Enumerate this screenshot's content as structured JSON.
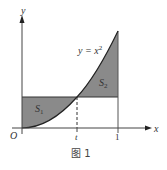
{
  "figure": {
    "caption": "图 1",
    "curve_label": "y = x",
    "curve_label_exp": "2",
    "axis_x_label": "x",
    "axis_y_label": "y",
    "origin_label": "O",
    "tick_t_label": "t",
    "tick_one_label": "1",
    "region1_label": "S",
    "region1_sub": "1",
    "region2_label": "S",
    "region2_sub": "2",
    "fill_color": "#8a8a8a",
    "line_color": "#333333"
  }
}
